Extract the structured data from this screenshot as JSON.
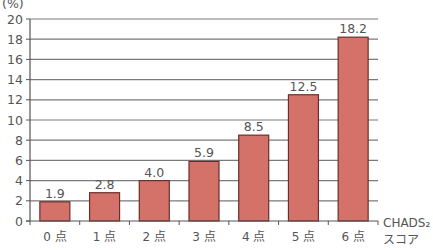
{
  "chart_data": {
    "type": "bar",
    "title": "",
    "ylabel": "(%)",
    "xlabel": "CHADS2 スコア",
    "xlabel_lines": [
      "CHADS₂",
      "スコア"
    ],
    "categories": [
      "0 点",
      "1 点",
      "2 点",
      "3 点",
      "4 点",
      "5 点",
      "6 点"
    ],
    "values": [
      1.9,
      2.8,
      4.0,
      5.9,
      8.5,
      12.5,
      18.2
    ],
    "value_labels": [
      "1.9",
      "2.8",
      "4.0",
      "5.9",
      "8.5",
      "12.5",
      "18.2"
    ],
    "ylim": [
      0,
      20
    ],
    "yticks": [
      0,
      2,
      4,
      6,
      8,
      10,
      12,
      14,
      16,
      18,
      20
    ],
    "grid": true,
    "legend": null
  },
  "colors": {
    "bar_fill": "#d4726a",
    "bar_stroke": "#6b2e2a",
    "grid": "#7a7a7a",
    "axis": "#555555",
    "text": "#555555"
  }
}
